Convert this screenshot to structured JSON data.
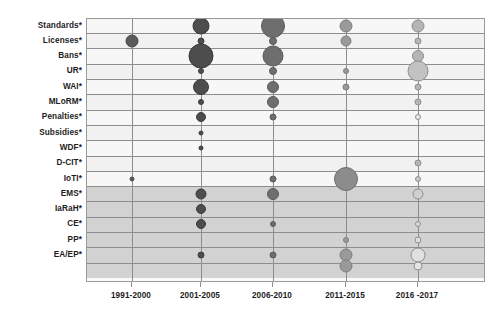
{
  "chart_data": {
    "type": "bubble",
    "title": "",
    "subtitle": "",
    "xlabel": "",
    "ylabel": "",
    "grid": true,
    "legend_position": "none",
    "x_categories": [
      "1991-2000",
      "2001-2005",
      "2006-2010",
      "2011-2015",
      "2016 -2017"
    ],
    "y_categories": [
      "Standards*",
      "Licenses*",
      "Bans*",
      "UR*",
      "WAI*",
      "MLoRM*",
      "Penalties*",
      "Subsidies*",
      "WDF*",
      "D-CIT*",
      "IoTI*",
      "EMS*",
      "IaRaH*",
      "CE*",
      "PP*",
      "EA/EP*"
    ],
    "bubble_size_unit": "px-diameter",
    "points": [
      {
        "x": "2001-2005",
        "y": "Standards*",
        "size": 17,
        "fill": "#4d4d4d",
        "stroke": "#3a3a3a"
      },
      {
        "x": "2006-2010",
        "y": "Standards*",
        "size": 24,
        "fill": "#6e6e6e",
        "stroke": "#5a5a5a"
      },
      {
        "x": "2011-2015",
        "y": "Standards*",
        "size": 13,
        "fill": "#9a9a9a",
        "stroke": "#7d7d7d"
      },
      {
        "x": "2016 -2017",
        "y": "Standards*",
        "size": 13,
        "fill": "#b5b5b5",
        "stroke": "#8f8f8f"
      },
      {
        "x": "1991-2000",
        "y": "Licenses*",
        "size": 13,
        "fill": "#5b5b5b",
        "stroke": "#474747"
      },
      {
        "x": "2001-2005",
        "y": "Licenses*",
        "size": 7,
        "fill": "#4d4d4d",
        "stroke": "#3a3a3a"
      },
      {
        "x": "2006-2010",
        "y": "Licenses*",
        "size": 8,
        "fill": "#6e6e6e",
        "stroke": "#5a5a5a"
      },
      {
        "x": "2011-2015",
        "y": "Licenses*",
        "size": 11,
        "fill": "#9a9a9a",
        "stroke": "#7d7d7d"
      },
      {
        "x": "2016 -2017",
        "y": "Licenses*",
        "size": 7,
        "fill": "#b5b5b5",
        "stroke": "#8f8f8f"
      },
      {
        "x": "2001-2005",
        "y": "Bans*",
        "size": 25,
        "fill": "#4d4d4d",
        "stroke": "#3a3a3a"
      },
      {
        "x": "2006-2010",
        "y": "Bans*",
        "size": 21,
        "fill": "#6e6e6e",
        "stroke": "#5a5a5a"
      },
      {
        "x": "2016 -2017",
        "y": "Bans*",
        "size": 12,
        "fill": "#b5b5b5",
        "stroke": "#8f8f8f"
      },
      {
        "x": "2001-2005",
        "y": "UR*",
        "size": 6,
        "fill": "#4d4d4d",
        "stroke": "#3a3a3a"
      },
      {
        "x": "2006-2010",
        "y": "UR*",
        "size": 8,
        "fill": "#6e6e6e",
        "stroke": "#5a5a5a"
      },
      {
        "x": "2011-2015",
        "y": "UR*",
        "size": 6,
        "fill": "#9a9a9a",
        "stroke": "#7d7d7d"
      },
      {
        "x": "2016 -2017",
        "y": "UR*",
        "size": 21,
        "fill": "#c2c2c2",
        "stroke": "#8f8f8f"
      },
      {
        "x": "2001-2005",
        "y": "WAI*",
        "size": 16,
        "fill": "#4d4d4d",
        "stroke": "#3a3a3a"
      },
      {
        "x": "2006-2010",
        "y": "WAI*",
        "size": 12,
        "fill": "#6e6e6e",
        "stroke": "#5a5a5a"
      },
      {
        "x": "2011-2015",
        "y": "WAI*",
        "size": 7,
        "fill": "#9a9a9a",
        "stroke": "#7d7d7d"
      },
      {
        "x": "2016 -2017",
        "y": "WAI*",
        "size": 7,
        "fill": "#b5b5b5",
        "stroke": "#8f8f8f"
      },
      {
        "x": "2001-2005",
        "y": "MLoRM*",
        "size": 6,
        "fill": "#4d4d4d",
        "stroke": "#3a3a3a"
      },
      {
        "x": "2006-2010",
        "y": "MLoRM*",
        "size": 12,
        "fill": "#6e6e6e",
        "stroke": "#5a5a5a"
      },
      {
        "x": "2016 -2017",
        "y": "MLoRM*",
        "size": 7,
        "fill": "#b5b5b5",
        "stroke": "#8f8f8f"
      },
      {
        "x": "2001-2005",
        "y": "Penalties*",
        "size": 10,
        "fill": "#4d4d4d",
        "stroke": "#3a3a3a"
      },
      {
        "x": "2006-2010",
        "y": "Penalties*",
        "size": 7,
        "fill": "#6e6e6e",
        "stroke": "#5a5a5a"
      },
      {
        "x": "2016 -2017",
        "y": "Penalties*",
        "size": 6,
        "fill": "#e8e8e8",
        "stroke": "#8f8f8f"
      },
      {
        "x": "2001-2005",
        "y": "Subsidies*",
        "size": 5,
        "fill": "#4d4d4d",
        "stroke": "#3a3a3a"
      },
      {
        "x": "2001-2005",
        "y": "WDF*",
        "size": 5,
        "fill": "#4d4d4d",
        "stroke": "#3a3a3a"
      },
      {
        "x": "2016 -2017",
        "y": "D-CIT*",
        "size": 7,
        "fill": "#b5b5b5",
        "stroke": "#8f8f8f"
      },
      {
        "x": "1991-2000",
        "y": "IoTI*",
        "size": 5,
        "fill": "#5b5b5b",
        "stroke": "#474747"
      },
      {
        "x": "2006-2010",
        "y": "IoTI*",
        "size": 7,
        "fill": "#6e6e6e",
        "stroke": "#5a5a5a"
      },
      {
        "x": "2011-2015",
        "y": "IoTI*",
        "size": 24,
        "fill": "#8c8c8c",
        "stroke": "#6f6f6f"
      },
      {
        "x": "2016 -2017",
        "y": "IoTI*",
        "size": 6,
        "fill": "#c9c9c9",
        "stroke": "#8f8f8f"
      },
      {
        "x": "2001-2005",
        "y": "EMS*",
        "size": 11,
        "fill": "#4d4d4d",
        "stroke": "#3a3a3a"
      },
      {
        "x": "2006-2010",
        "y": "EMS*",
        "size": 12,
        "fill": "#6e6e6e",
        "stroke": "#5a5a5a"
      },
      {
        "x": "2016 -2017",
        "y": "EMS*",
        "size": 11,
        "fill": "#cfcfcf",
        "stroke": "#8f8f8f"
      },
      {
        "x": "2001-2005",
        "y": "IaRaH*",
        "size": 10,
        "fill": "#4d4d4d",
        "stroke": "#3a3a3a"
      },
      {
        "x": "2001-2005",
        "y": "CE*",
        "size": 10,
        "fill": "#4d4d4d",
        "stroke": "#3a3a3a"
      },
      {
        "x": "2006-2010",
        "y": "CE*",
        "size": 6,
        "fill": "#6e6e6e",
        "stroke": "#5a5a5a"
      },
      {
        "x": "2016 -2017",
        "y": "CE*",
        "size": 6,
        "fill": "#d8d8d8",
        "stroke": "#8f8f8f"
      },
      {
        "x": "2011-2015",
        "y": "PP*",
        "size": 6,
        "fill": "#9a9a9a",
        "stroke": "#7d7d7d"
      },
      {
        "x": "2016 -2017",
        "y": "PP*",
        "size": 7,
        "fill": "#dcdcdc",
        "stroke": "#8f8f8f"
      },
      {
        "x": "2001-2005",
        "y": "EA/EP*",
        "size": 7,
        "fill": "#4d4d4d",
        "stroke": "#3a3a3a"
      },
      {
        "x": "2006-2010",
        "y": "EA/EP*",
        "size": 7,
        "fill": "#6e6e6e",
        "stroke": "#5a5a5a"
      },
      {
        "x": "2011-2015",
        "y": "EA/EP*",
        "size": 13,
        "fill": "#9a9a9a",
        "stroke": "#7d7d7d"
      },
      {
        "x": "2016 -2017",
        "y": "EA/EP*",
        "size": 15,
        "fill": "#e0e0e0",
        "stroke": "#8f8f8f"
      },
      {
        "x": "2011-2015",
        "y": "EA/EP-lower",
        "size": 13,
        "fill": "#9a9a9a",
        "stroke": "#7d7d7d"
      },
      {
        "x": "2016 -2017",
        "y": "EA/EP-lower",
        "size": 9,
        "fill": "#e4e4e4",
        "stroke": "#8f8f8f"
      }
    ],
    "colors": {
      "period_1991_2000": "#5b5b5b",
      "period_2001_2005": "#4d4d4d",
      "period_2006_2010": "#6e6e6e",
      "period_2011_2015": "#9a9a9a",
      "period_2016_2017": "#c8c8c8",
      "grid_line": "#8d8d8d",
      "plot_border": "#9a9a9a",
      "band_light": "#f7f7f7",
      "band_dark": "#d2d2d2",
      "text": "#1d1d1d"
    }
  }
}
